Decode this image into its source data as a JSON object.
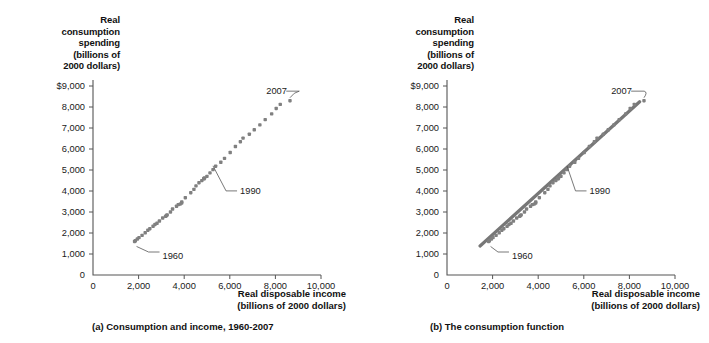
{
  "figure": {
    "axis_color": "#555555",
    "marker_color": "#808080",
    "line_color": "#777777",
    "text_color": "#1a1a1a"
  },
  "panels": [
    {
      "id": "a",
      "caption": "(a) Consumption and income, 1960-2007",
      "ylabel_lines": [
        "Real",
        "consumption",
        "spending",
        "(billions of",
        "2000 dollars)"
      ],
      "xlabel_lines": [
        "Real disposable income",
        "(billions of 2000 dollars)"
      ],
      "annotations": [
        {
          "label": "2007",
          "x": 7600,
          "y": 8850
        },
        {
          "label": "1990",
          "x": 6450,
          "y": 4100
        },
        {
          "label": "1960",
          "x": 3050,
          "y": 1000
        }
      ]
    },
    {
      "id": "b",
      "caption": "(b)  The consumption function",
      "ylabel_lines": [
        "Real",
        "consumption",
        "spending",
        "(billions of",
        "2000 dollars)"
      ],
      "xlabel_lines": [
        "Real disposable income",
        "(billions of 2000 dollars)"
      ],
      "annotations": [
        {
          "label": "2007",
          "x": 7200,
          "y": 8850
        },
        {
          "label": "1990",
          "x": 6250,
          "y": 4100
        },
        {
          "label": "1960",
          "x": 2850,
          "y": 1000
        }
      ]
    }
  ],
  "chart_data": {
    "type": "scatter",
    "title": "Consumption and income, 1960-2007",
    "xlabel": "Real disposable income (billions of 2000 dollars)",
    "ylabel": "Real consumption spending (billions of 2000 dollars)",
    "xlim": [
      0,
      10000
    ],
    "ylim": [
      0,
      9000
    ],
    "xticks": [
      0,
      2000,
      4000,
      6000,
      8000,
      10000
    ],
    "xticklabels": [
      "0",
      "2,000",
      "4,000",
      "6,000",
      "8,000",
      "10,000"
    ],
    "yticks": [
      0,
      1000,
      2000,
      3000,
      4000,
      5000,
      6000,
      7000,
      8000,
      9000
    ],
    "yticklabels": [
      "0",
      "1,000",
      "2,000",
      "3,000",
      "4,000",
      "5,000",
      "6,000",
      "7,000",
      "8,000",
      "$9,000"
    ],
    "grid": false,
    "legend": false,
    "series": [
      {
        "name": "Consumption vs disposable income, 1960-2007",
        "marker": "square",
        "points": [
          [
            1823,
            1597
          ],
          [
            1858,
            1630
          ],
          [
            1943,
            1711
          ],
          [
            2018,
            1781
          ],
          [
            2153,
            1889
          ],
          [
            2289,
            2013
          ],
          [
            2406,
            2133
          ],
          [
            2493,
            2204
          ],
          [
            2634,
            2318
          ],
          [
            2719,
            2406
          ],
          [
            2808,
            2463
          ],
          [
            2913,
            2570
          ],
          [
            3056,
            2714
          ],
          [
            3220,
            2830
          ],
          [
            3184,
            2794
          ],
          [
            3254,
            2865
          ],
          [
            3398,
            3003
          ],
          [
            3489,
            3141
          ],
          [
            3663,
            3273
          ],
          [
            3740,
            3352
          ],
          [
            3822,
            3375
          ],
          [
            3886,
            3423
          ],
          [
            3893,
            3475
          ],
          [
            4049,
            3680
          ],
          [
            4288,
            3919
          ],
          [
            4426,
            4077
          ],
          [
            4517,
            4246
          ],
          [
            4648,
            4395
          ],
          [
            4772,
            4495
          ],
          [
            4858,
            4595
          ],
          [
            4896,
            4624
          ],
          [
            4874,
            4578
          ],
          [
            4998,
            4696
          ],
          [
            5131,
            4863
          ],
          [
            5263,
            5017
          ],
          [
            5379,
            5182
          ],
          [
            5605,
            5370
          ],
          [
            5768,
            5553
          ],
          [
            6017,
            5834
          ],
          [
            6246,
            6120
          ],
          [
            6463,
            6348
          ],
          [
            6581,
            6520
          ],
          [
            6857,
            6704
          ],
          [
            7073,
            6914
          ],
          [
            7319,
            7149
          ],
          [
            7553,
            7397
          ],
          [
            7836,
            7675
          ],
          [
            8035,
            7932
          ],
          [
            8214,
            8124
          ],
          [
            8640,
            8300
          ]
        ]
      }
    ],
    "fit_line": {
      "name": "The consumption function",
      "points": [
        [
          1450,
          1380
        ],
        [
          8450,
          8250
        ]
      ]
    },
    "annotation_values": {
      "1960": [
        1823,
        1597
      ],
      "1990": [
        5131,
        4863
      ],
      "2007": [
        8640,
        8300
      ]
    }
  }
}
